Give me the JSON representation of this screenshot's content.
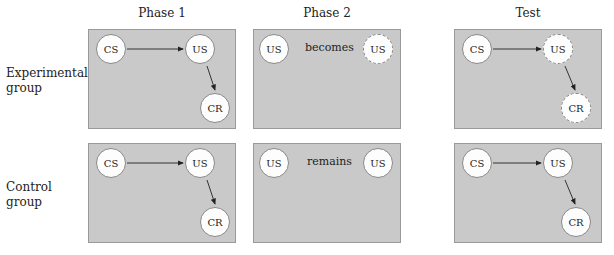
{
  "columns": [
    {
      "id": "phase1",
      "label": "Phase 1"
    },
    {
      "id": "phase2",
      "label": "Phase 2"
    },
    {
      "id": "test",
      "label": "Test"
    }
  ],
  "rows": [
    {
      "id": "experimental",
      "label_line1": "Experimental",
      "label_line2": "group"
    },
    {
      "id": "control",
      "label_line1": "Control",
      "label_line2": "group"
    }
  ],
  "panels": {
    "experimental": {
      "phase1": {
        "cs": "CS",
        "us": "US",
        "cr": "CR"
      },
      "phase2": {
        "us_left": "US",
        "relation": "becomes",
        "us_right": "US",
        "us_right_style": "dashed"
      },
      "test": {
        "cs": "CS",
        "us": "US",
        "cr": "CR",
        "us_style": "dashed",
        "cr_style": "dashed"
      }
    },
    "control": {
      "phase1": {
        "cs": "CS",
        "us": "US",
        "cr": "CR"
      },
      "phase2": {
        "us_left": "US",
        "relation": "remains",
        "us_right": "US",
        "us_right_style": "solid"
      },
      "test": {
        "cs": "CS",
        "us": "US",
        "cr": "CR",
        "us_style": "solid",
        "cr_style": "solid"
      }
    }
  },
  "colors": {
    "panel_bg": "#c9c9c9",
    "node_bg": "#fdfdfd",
    "panel_border": "#9a9a9a"
  }
}
